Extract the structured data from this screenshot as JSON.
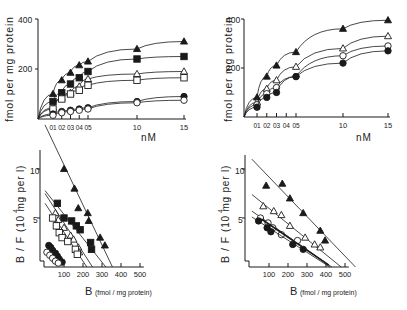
{
  "figure": {
    "panels": [
      "top-left saturation",
      "top-right saturation",
      "bottom-left scatchard",
      "bottom-right scatchard"
    ]
  },
  "chart_data": [
    {
      "id": "top_left",
      "type": "line",
      "title": "",
      "xlabel": "nM",
      "ylabel": "fmol per mg protein",
      "x_tick_labels": [
        "01",
        "02",
        "03",
        "04",
        "05",
        "10",
        "15"
      ],
      "y_tick_labels": [
        "200",
        "400"
      ],
      "x": [
        0.1,
        0.2,
        0.3,
        0.4,
        0.5,
        10,
        15
      ],
      "ylim": [
        0,
        400
      ],
      "grid": false,
      "series": [
        {
          "name": "filled-triangle",
          "marker": "▲",
          "values": [
            100,
            155,
            185,
            215,
            230,
            280,
            310
          ]
        },
        {
          "name": "filled-square",
          "marker": "■",
          "values": [
            70,
            105,
            140,
            165,
            190,
            240,
            250
          ]
        },
        {
          "name": "open-triangle",
          "marker": "△",
          "values": [
            45,
            85,
            105,
            130,
            160,
            180,
            190
          ]
        },
        {
          "name": "open-square",
          "marker": "□",
          "values": [
            40,
            80,
            100,
            115,
            135,
            155,
            165
          ]
        },
        {
          "name": "filled-circle",
          "marker": "●",
          "values": [
            20,
            30,
            35,
            40,
            45,
            70,
            90
          ]
        },
        {
          "name": "open-circle",
          "marker": "○",
          "values": [
            15,
            25,
            30,
            35,
            40,
            65,
            75
          ]
        }
      ]
    },
    {
      "id": "top_right",
      "type": "line",
      "title": "",
      "xlabel": "nM",
      "ylabel": "fmol per mg protein",
      "x_tick_labels": [
        "01",
        "02",
        "03",
        "04",
        "05",
        "10",
        "15"
      ],
      "y_tick_labels": [
        "200",
        "400"
      ],
      "x": [
        0.1,
        0.2,
        0.3,
        0.5,
        10,
        15
      ],
      "ylim": [
        0,
        400
      ],
      "grid": false,
      "series": [
        {
          "name": "filled-triangle",
          "marker": "▲",
          "values": [
            80,
            165,
            210,
            265,
            360,
            395
          ]
        },
        {
          "name": "open-triangle",
          "marker": "△",
          "values": [
            60,
            115,
            150,
            205,
            280,
            330
          ]
        },
        {
          "name": "open-circle",
          "marker": "○",
          "values": [
            50,
            95,
            120,
            165,
            250,
            290
          ]
        },
        {
          "name": "filled-circle",
          "marker": "●",
          "values": [
            40,
            80,
            100,
            165,
            220,
            270
          ]
        }
      ]
    },
    {
      "id": "bottom_left",
      "type": "scatter",
      "title": "",
      "xlabel": "B (fmol / mg protein)",
      "ylabel": "B / F (10^4 mg per l)",
      "x_tick_labels": [
        "100",
        "200",
        "300",
        "400",
        "500"
      ],
      "y_tick_labels": [
        "5",
        "10"
      ],
      "xlim": [
        0,
        500
      ],
      "ylim": [
        0,
        12
      ],
      "grid": false,
      "series": [
        {
          "name": "filled-triangle",
          "marker": "▲",
          "x": [
            100,
            155,
            175,
            225,
            230,
            290,
            315
          ],
          "y": [
            10,
            8,
            6,
            5.5,
            4.7,
            3,
            2.2
          ],
          "fit": [
            [
              0,
              14.5
            ],
            [
              355,
              0
            ]
          ]
        },
        {
          "name": "filled-square",
          "marker": "■",
          "x": [
            65,
            100,
            140,
            165,
            185,
            240,
            245
          ],
          "y": [
            6.5,
            5,
            4.7,
            4.2,
            3.8,
            2.5,
            1.8
          ],
          "fit": [
            [
              0,
              7.8
            ],
            [
              320,
              0
            ]
          ]
        },
        {
          "name": "open-triangle",
          "marker": "△",
          "x": [
            55,
            70,
            100,
            135,
            150,
            175,
            180
          ],
          "y": [
            5.5,
            4.8,
            4.0,
            3.2,
            2.8,
            2.0,
            1.5
          ],
          "fit": [
            [
              0,
              7.5
            ],
            [
              250,
              0
            ]
          ]
        },
        {
          "name": "open-square",
          "marker": "□",
          "x": [
            40,
            60,
            75,
            90,
            120,
            160,
            170
          ],
          "y": [
            5.0,
            4.2,
            3.5,
            3.0,
            2.6,
            1.8,
            1.3
          ],
          "fit": [
            [
              0,
              6.5
            ],
            [
              220,
              0
            ]
          ]
        },
        {
          "name": "filled-circle",
          "marker": "●",
          "x": [
            20,
            30,
            40,
            55,
            65,
            75,
            90
          ],
          "y": [
            2.2,
            2.0,
            1.7,
            1.4,
            1.1,
            0.8,
            0.5
          ],
          "fit": null
        },
        {
          "name": "open-circle",
          "marker": "○",
          "x": [
            10,
            25,
            40,
            55,
            70
          ],
          "y": [
            1.5,
            1.2,
            0.9,
            0.6,
            0.4
          ],
          "fit": null
        }
      ]
    },
    {
      "id": "bottom_right",
      "type": "scatter",
      "title": "",
      "xlabel": "B (fmol / mg protein)",
      "ylabel": "B / F (10^4 mg per l)",
      "x_tick_labels": [
        "100",
        "200",
        "300",
        "400",
        "500"
      ],
      "y_tick_labels": [
        "5",
        "10"
      ],
      "xlim": [
        0,
        500
      ],
      "ylim": [
        0,
        12
      ],
      "grid": false,
      "series": [
        {
          "name": "filled-triangle",
          "marker": "▲",
          "x": [
            85,
            170,
            210,
            280,
            370,
            395
          ],
          "y": [
            8.3,
            8.5,
            7.0,
            5.5,
            3.7,
            2.7
          ],
          "fit": [
            [
              10,
              11
            ],
            [
              555,
              0
            ]
          ]
        },
        {
          "name": "open-triangle",
          "marker": "△",
          "x": [
            70,
            125,
            165,
            210,
            290,
            340,
            370
          ],
          "y": [
            6.2,
            5.7,
            5.3,
            4.2,
            3.0,
            2.3,
            2.0
          ],
          "fit": [
            [
              10,
              7.4
            ],
            [
              480,
              0
            ]
          ]
        },
        {
          "name": "open-circle",
          "marker": "○",
          "x": [
            55,
            95,
            120,
            165,
            250
          ],
          "y": [
            5.0,
            4.5,
            4.0,
            3.3,
            2.7
          ],
          "fit": [
            [
              10,
              5.7
            ],
            [
              430,
              0
            ]
          ]
        },
        {
          "name": "filled-circle",
          "marker": "●",
          "x": [
            45,
            90,
            110,
            225,
            280
          ],
          "y": [
            4.7,
            4.0,
            3.6,
            2.3,
            1.8
          ],
          "fit": [
            [
              10,
              5.1
            ],
            [
              420,
              0
            ]
          ]
        }
      ]
    }
  ],
  "labels": {
    "top_ylabel": "fmol per mg protein",
    "top_xlabel": "nM",
    "bottom_ylabel_prefix": "B / F",
    "bottom_ylabel_units": "(10  mg per l)",
    "bottom_ylabel_exp": "4",
    "bottom_xlabel_B": "B",
    "bottom_xlabel_units": "(fmol / mg protein)",
    "top_y400": "400",
    "top_y200": "200",
    "bottom_y10": "10",
    "bottom_y5": "5",
    "top_x": [
      "01",
      "02",
      "03",
      "04",
      "05",
      "10",
      "15"
    ],
    "bottom_x": [
      "100",
      "200",
      "300",
      "400",
      "500"
    ]
  }
}
